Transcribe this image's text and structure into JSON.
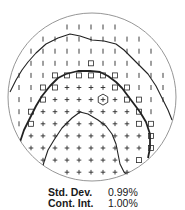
{
  "figure": {
    "type": "visual-field-grayscale-map",
    "circle": {
      "cx": 92,
      "cy": 97,
      "r": 84,
      "stroke": "#8a8a8a"
    },
    "grid": {
      "x0": 19,
      "y0": 27,
      "dx": 12,
      "dy": 12.1,
      "legend_symbols": {
        "|": "tick",
        "s": "square",
        "+": "plus",
        "h": "plus-in-hexagon"
      },
      "rows": [
        {
          "y_index": 0,
          "cells": [
            [
              4,
              "|"
            ],
            [
              5,
              "|"
            ],
            [
              6,
              "|"
            ],
            [
              7,
              "|"
            ],
            [
              8,
              "|"
            ]
          ]
        },
        {
          "y_index": 1,
          "cells": [
            [
              2,
              "|"
            ],
            [
              3,
              "|"
            ],
            [
              4,
              "|"
            ],
            [
              5,
              "|"
            ],
            [
              6,
              "|"
            ],
            [
              7,
              "|"
            ],
            [
              8,
              "|"
            ],
            [
              9,
              "|"
            ],
            [
              10,
              "|"
            ]
          ]
        },
        {
          "y_index": 2,
          "cells": [
            [
              1,
              "|"
            ],
            [
              2,
              "|"
            ],
            [
              3,
              "|"
            ],
            [
              4,
              "|"
            ],
            [
              5,
              "|"
            ],
            [
              6,
              "|"
            ],
            [
              7,
              "|"
            ],
            [
              8,
              "|"
            ],
            [
              9,
              "|"
            ],
            [
              10,
              "|"
            ],
            [
              11,
              "|"
            ]
          ]
        },
        {
          "y_index": 3,
          "cells": [
            [
              1,
              "|"
            ],
            [
              2,
              "|"
            ],
            [
              3,
              "|"
            ],
            [
              4,
              "|"
            ],
            [
              5,
              "|"
            ],
            [
              6,
              "s"
            ],
            [
              7,
              "|"
            ],
            [
              8,
              "|"
            ],
            [
              9,
              "|"
            ],
            [
              10,
              "|"
            ],
            [
              11,
              "|"
            ]
          ]
        },
        {
          "y_index": 4,
          "cells": [
            [
              0,
              "|"
            ],
            [
              1,
              "|"
            ],
            [
              2,
              "|"
            ],
            [
              3,
              "s"
            ],
            [
              4,
              "s"
            ],
            [
              5,
              "s"
            ],
            [
              6,
              "s"
            ],
            [
              7,
              "s"
            ],
            [
              8,
              "s"
            ],
            [
              9,
              "|"
            ],
            [
              10,
              "|"
            ],
            [
              11,
              "|"
            ],
            [
              12,
              "|"
            ]
          ]
        },
        {
          "y_index": 5,
          "cells": [
            [
              0,
              "|"
            ],
            [
              1,
              "|"
            ],
            [
              2,
              "s"
            ],
            [
              3,
              "s"
            ],
            [
              4,
              "+"
            ],
            [
              5,
              "+"
            ],
            [
              6,
              "+"
            ],
            [
              7,
              "+"
            ],
            [
              8,
              "s"
            ],
            [
              9,
              "s"
            ],
            [
              10,
              "|"
            ],
            [
              11,
              "|"
            ],
            [
              12,
              "|"
            ]
          ]
        },
        {
          "y_index": 6,
          "cells": [
            [
              0,
              "|"
            ],
            [
              1,
              "|"
            ],
            [
              2,
              "s"
            ],
            [
              3,
              "+"
            ],
            [
              4,
              "+"
            ],
            [
              5,
              "+"
            ],
            [
              6,
              "+"
            ],
            [
              7,
              "h"
            ],
            [
              8,
              "+"
            ],
            [
              9,
              "s"
            ],
            [
              10,
              "s"
            ],
            [
              11,
              "|"
            ],
            [
              12,
              "|"
            ]
          ]
        },
        {
          "y_index": 7,
          "cells": [
            [
              0,
              "|"
            ],
            [
              1,
              "s"
            ],
            [
              2,
              "+"
            ],
            [
              3,
              "+"
            ],
            [
              4,
              "+"
            ],
            [
              5,
              "+"
            ],
            [
              6,
              "+"
            ],
            [
              7,
              "+"
            ],
            [
              8,
              "+"
            ],
            [
              9,
              "+"
            ],
            [
              10,
              "s"
            ],
            [
              11,
              "|"
            ]
          ]
        },
        {
          "y_index": 8,
          "cells": [
            [
              0,
              "|"
            ],
            [
              1,
              "s"
            ],
            [
              2,
              "+"
            ],
            [
              3,
              "+"
            ],
            [
              4,
              "+"
            ],
            [
              5,
              "+"
            ],
            [
              6,
              "+"
            ],
            [
              7,
              "+"
            ],
            [
              8,
              "+"
            ],
            [
              9,
              "+"
            ],
            [
              10,
              "s"
            ],
            [
              11,
              "s"
            ]
          ]
        },
        {
          "y_index": 9,
          "cells": [
            [
              1,
              "+"
            ],
            [
              2,
              "+"
            ],
            [
              3,
              "+"
            ],
            [
              4,
              "+"
            ],
            [
              5,
              "+"
            ],
            [
              6,
              "+"
            ],
            [
              7,
              "+"
            ],
            [
              8,
              "+"
            ],
            [
              9,
              "+"
            ],
            [
              10,
              "+"
            ],
            [
              11,
              "s"
            ]
          ]
        },
        {
          "y_index": 10,
          "cells": [
            [
              1,
              "+"
            ],
            [
              2,
              "+"
            ],
            [
              3,
              "+"
            ],
            [
              4,
              "+"
            ],
            [
              5,
              "+"
            ],
            [
              6,
              "+"
            ],
            [
              7,
              "+"
            ],
            [
              8,
              "+"
            ],
            [
              9,
              "+"
            ],
            [
              10,
              "+"
            ],
            [
              11,
              "s"
            ]
          ]
        },
        {
          "y_index": 11,
          "cells": [
            [
              2,
              "+"
            ],
            [
              3,
              "+"
            ],
            [
              4,
              "+"
            ],
            [
              5,
              "+"
            ],
            [
              6,
              "+"
            ],
            [
              7,
              "+"
            ],
            [
              8,
              "+"
            ],
            [
              9,
              "+"
            ],
            [
              10,
              "s"
            ]
          ]
        },
        {
          "y_index": 12,
          "cells": [
            [
              4,
              "+"
            ],
            [
              5,
              "+"
            ],
            [
              6,
              "+"
            ],
            [
              7,
              "+"
            ],
            [
              8,
              "+"
            ],
            [
              9,
              "+"
            ]
          ]
        }
      ]
    },
    "contours": [
      {
        "name": "outer-contour",
        "width": 1.1,
        "points": "10,92 16,80 22,70 28,62 36,53 46,44 58,38 70,34 80,36 92,40 104,41 116,44 124,50 132,58 140,66 148,74 156,86 162,98 168,110 172,120"
      },
      {
        "name": "inner-contour-thick",
        "width": 1.8,
        "points": "14,180 16,160 20,142 24,130 30,118 36,106 42,96 50,86 58,78 66,74 78,71 90,71 100,72 108,76 116,82 122,88 128,96 134,104 140,112 146,122 150,134 150,148 148,158"
      },
      {
        "name": "center-contour",
        "width": 1.1,
        "points": "40,176 44,162 48,150 54,140 62,128 72,118 80,112 88,114 98,120 106,126 112,134 116,144 118,154 120,164 124,172 130,178"
      }
    ],
    "symbol_color": "#2a2a2a",
    "contour_color": "#222222"
  },
  "stats": {
    "std_dev_label": "Std. Dev.",
    "std_dev_value": "0.99%",
    "cont_int_label": "Cont. Int.",
    "cont_int_value": "1.00%"
  }
}
